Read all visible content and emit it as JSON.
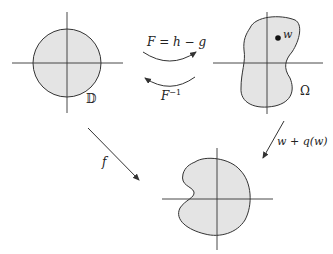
{
  "diagram": {
    "type": "commutative-mapping-diagram",
    "colors": {
      "stroke": "#333333",
      "fill": "#e4e4e4",
      "text": "#222222",
      "background": "#ffffff"
    },
    "nodes": {
      "disk": {
        "label": "𝔻",
        "shape": "unit-disk"
      },
      "omega": {
        "label": "Ω",
        "point_label": "w",
        "shape": "blob-domain"
      },
      "image": {
        "label": "",
        "shape": "kidney-domain"
      }
    },
    "edges": {
      "forward": {
        "label_main": "F = h − g",
        "from": "disk",
        "to": "omega"
      },
      "inverse": {
        "label_main": "F",
        "label_sup": "−1",
        "from": "omega",
        "to": "disk"
      },
      "f_map": {
        "label": "f",
        "from": "disk",
        "to": "image"
      },
      "q_map": {
        "label": "w + q(w)",
        "from": "omega",
        "to": "image"
      }
    }
  }
}
